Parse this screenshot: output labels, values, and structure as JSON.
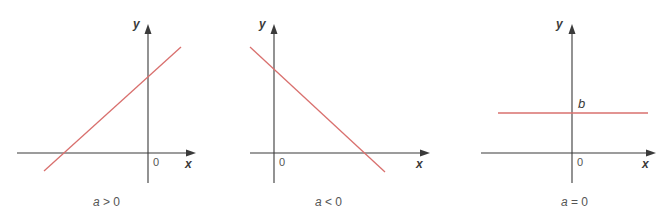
{
  "panels": [
    {
      "id": "positive-slope",
      "caption_var": "a",
      "caption_rel": " > 0",
      "x_axis_label": "x",
      "y_axis_label": "y",
      "origin_label": "0",
      "line_description": "increasing line, y = ax + b with a > 0"
    },
    {
      "id": "negative-slope",
      "caption_var": "a",
      "caption_rel": " < 0",
      "x_axis_label": "x",
      "y_axis_label": "y",
      "origin_label": "0",
      "line_description": "decreasing line, y = ax + b with a < 0"
    },
    {
      "id": "zero-slope",
      "caption_var": "a",
      "caption_rel": " = 0",
      "x_axis_label": "x",
      "y_axis_label": "y",
      "origin_label": "0",
      "intercept_label": "b",
      "line_description": "horizontal line y = b with a = 0"
    }
  ],
  "colors": {
    "axis": "#3a3a3a",
    "line": "#d9706e",
    "text": "#555555"
  }
}
